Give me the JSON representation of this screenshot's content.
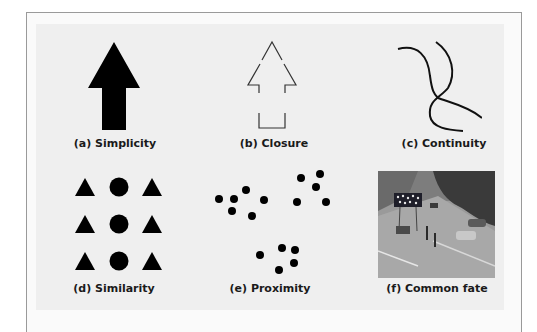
{
  "figure": {
    "panels": [
      {
        "id": "a",
        "caption": "(a) Simplicity"
      },
      {
        "id": "b",
        "caption": "(b) Closure"
      },
      {
        "id": "c",
        "caption": "(c) Continuity"
      },
      {
        "id": "d",
        "caption": "(d) Similarity"
      },
      {
        "id": "e",
        "caption": "(e) Proximity"
      },
      {
        "id": "f",
        "caption": "(f) Common fate"
      }
    ],
    "colors": {
      "ink": "#000000",
      "panel_background": "#efefef",
      "frame_border": "#9a9a9a"
    }
  }
}
